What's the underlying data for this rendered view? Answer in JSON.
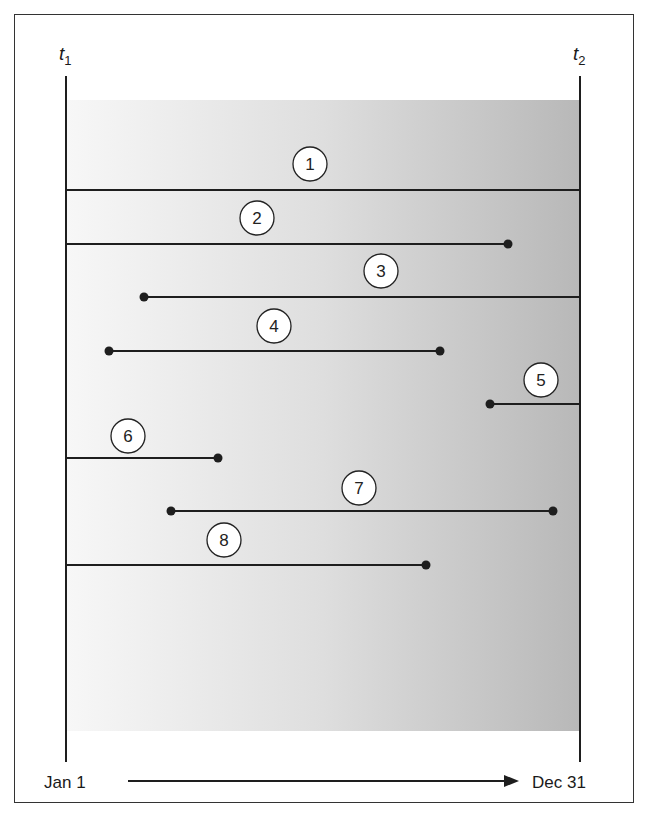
{
  "diagram": {
    "time_markers": {
      "start": {
        "symbol": "t",
        "subscript": "1"
      },
      "end": {
        "symbol": "t",
        "subscript": "2"
      }
    },
    "axis": {
      "start_label": "Jan 1",
      "end_label": "Dec 31",
      "direction": "left-to-right arrow"
    },
    "colors": {
      "line": "#1e1e1e",
      "shade_light": "#f6f6f6",
      "shade_dark": "#b9b9b9",
      "circle_fill": "#ffffff"
    },
    "segments": [
      {
        "id": "1",
        "label": "1",
        "start": "before t1",
        "end": "after t2",
        "start_dot": false,
        "end_dot": false
      },
      {
        "id": "2",
        "label": "2",
        "start": "before t1",
        "end": "within period",
        "start_dot": false,
        "end_dot": true
      },
      {
        "id": "3",
        "label": "3",
        "start": "within period",
        "end": "after t2",
        "start_dot": true,
        "end_dot": false
      },
      {
        "id": "4",
        "label": "4",
        "start": "within period",
        "end": "within period",
        "start_dot": true,
        "end_dot": true
      },
      {
        "id": "5",
        "label": "5",
        "start": "within period",
        "end": "after t2",
        "start_dot": true,
        "end_dot": false
      },
      {
        "id": "6",
        "label": "6",
        "start": "before t1",
        "end": "within period",
        "start_dot": false,
        "end_dot": true
      },
      {
        "id": "7",
        "label": "7",
        "start": "within period",
        "end": "within period",
        "start_dot": true,
        "end_dot": true
      },
      {
        "id": "8",
        "label": "8",
        "start": "before t1",
        "end": "within period",
        "start_dot": false,
        "end_dot": true
      }
    ]
  }
}
